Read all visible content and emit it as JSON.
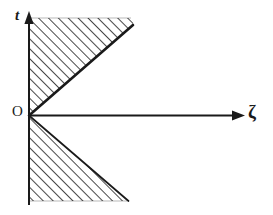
{
  "figure": {
    "kind": "hand-drawn-mathematical-diagram",
    "background_color": "#ffffff",
    "ink_color": "#1a1a1a",
    "axes": {
      "vertical": {
        "label": "t",
        "label_style": "italic",
        "arrow_direction": "up",
        "x": 29,
        "y_top": 14,
        "y_bottom": 205
      },
      "horizontal": {
        "label": "ζ",
        "label_name": "zeta",
        "arrow_direction": "right",
        "y": 115,
        "x_left": 29,
        "x_right": 243
      },
      "origin": {
        "label": "O",
        "x": 29,
        "y": 115
      }
    },
    "regions": [
      {
        "name": "upper-wedge",
        "hatched": true,
        "hatch_angle_degrees": 45,
        "hatch_direction": "up-right",
        "vertices": [
          [
            29,
            115
          ],
          [
            29,
            18
          ],
          [
            133,
            18
          ],
          [
            133,
            26
          ]
        ],
        "boundary_line": {
          "from": [
            29,
            115
          ],
          "to": [
            133,
            26
          ],
          "thick": true
        }
      },
      {
        "name": "lower-wedge",
        "hatched": true,
        "hatch_angle_degrees": 45,
        "hatch_direction": "up-right",
        "vertices": [
          [
            29,
            115
          ],
          [
            29,
            201
          ],
          [
            128,
            201
          ]
        ],
        "boundary_line": {
          "from": [
            29,
            115
          ],
          "to": [
            128,
            201
          ],
          "thick": false
        }
      }
    ]
  }
}
